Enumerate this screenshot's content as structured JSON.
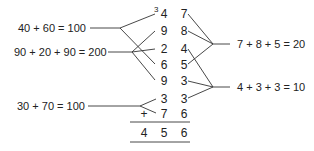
{
  "left_equations": [
    {
      "text": "40 + 60 = 100"
    },
    {
      "text": "90 + 20 + 90 = 200"
    },
    {
      "text": "30 + 70 = 100"
    }
  ],
  "right_equations": [
    {
      "text": "7 + 8 + 5 = 20"
    },
    {
      "text": "4 + 3 + 3 = 10"
    }
  ],
  "addition": {
    "carry": "3",
    "rows": [
      [
        "4",
        "7"
      ],
      [
        "9",
        "8"
      ],
      [
        "2",
        "4"
      ],
      [
        "6",
        "5"
      ],
      [
        "9",
        "3"
      ],
      [
        "3",
        "3"
      ],
      [
        "7",
        "6"
      ]
    ],
    "operator": "+",
    "result": [
      "4",
      "5",
      "6"
    ]
  }
}
